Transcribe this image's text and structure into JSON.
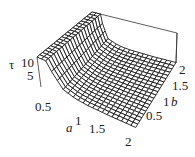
{
  "chart_data": {
    "type": "surface3d",
    "title": "",
    "xlabel": "a",
    "ylabel": "b",
    "zlabel": "τ",
    "x_ticks": [
      "0.5",
      "1",
      "1.5",
      "2"
    ],
    "y_ticks": [
      "0.5",
      "1",
      "1.5",
      "2"
    ],
    "z_ticks": [
      "5",
      "10"
    ],
    "xlim": [
      0,
      2
    ],
    "ylim": [
      0,
      2
    ],
    "zlim": [
      0,
      12
    ],
    "grid_resolution": [
      20,
      20
    ],
    "sample_values": {
      "a": [
        0.1,
        0.2,
        0.3,
        0.5,
        0.75,
        1.0,
        1.5,
        2.0
      ],
      "tau": [
        12,
        12,
        8.5,
        3.0,
        1.3,
        0.7,
        0.3,
        0.2
      ]
    },
    "box": true,
    "grid": false,
    "legend": null
  },
  "labels": {
    "z_axis": "τ",
    "z_tick_10": "10",
    "z_tick_5": "5",
    "a_axis": "a",
    "a_tick_05": "0.5",
    "a_tick_1": "1",
    "a_tick_15": "1.5",
    "a_tick_2": "2",
    "b_axis": "b",
    "b_tick_2": "2",
    "b_tick_15": "1.5",
    "b_tick_1": "1",
    "b_tick_05": "0.5"
  },
  "colors": {
    "mesh": "#1a1a1a",
    "fill": "#ffffff",
    "box": "#333333"
  }
}
